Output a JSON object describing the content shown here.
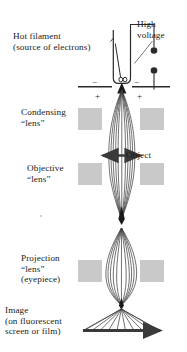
{
  "figure": {
    "background_color": "#ffffff",
    "ink_color": "#1a1a1a",
    "lens_block_color": "#c9c9c9",
    "ray_color": "#3a3a3a",
    "width": 187,
    "height": 352
  },
  "labels": {
    "hot_filament": "Hot filament\n(source of electrons)",
    "high_voltage": "High\nvoltage",
    "condensing_lens": "Condensing\n“lens”",
    "objective_lens": "Objective\n“lens”",
    "object": "Object",
    "projection_lens": "Projection\n“lens”\n(eyepiece)",
    "image": "Image\n(on fluorescent\nscreen or film)"
  },
  "annotations": {
    "anode_minus_left": "−",
    "anode_minus_right": "−",
    "anode_plus_left": "+",
    "anode_plus_right": "+"
  },
  "components": [
    {
      "name": "hot-filament-cup",
      "label": "Hot filament (source of electrons)"
    },
    {
      "name": "high-voltage-supply",
      "label": "High voltage"
    },
    {
      "name": "anode-plate",
      "label": "Anode plate"
    },
    {
      "name": "condensing-lens",
      "label": "Condensing “lens”"
    },
    {
      "name": "object-specimen",
      "label": "Object"
    },
    {
      "name": "objective-lens",
      "label": "Objective “lens”"
    },
    {
      "name": "projection-lens",
      "label": "Projection “lens” (eyepiece)"
    },
    {
      "name": "image-screen",
      "label": "Image (on fluorescent screen or film)"
    }
  ]
}
